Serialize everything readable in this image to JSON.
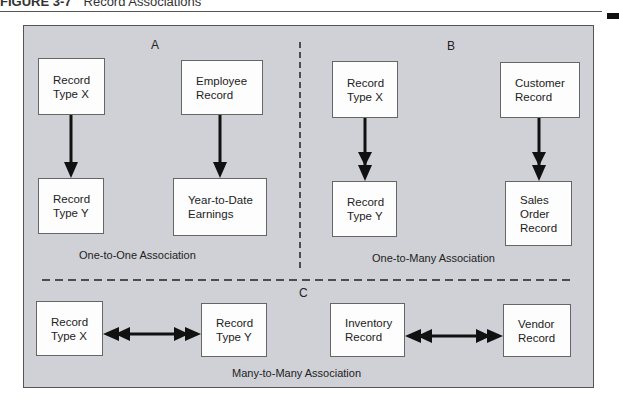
{
  "figure": {
    "number": "FIGURE 3-7",
    "title": "Record Associations"
  },
  "colors": {
    "panel_bg": "#cfd1d6",
    "box_bg": "#fdfdfd",
    "line": "#111111"
  },
  "sections": {
    "a": {
      "label": "A",
      "caption": "One-to-One Association",
      "relationships": [
        {
          "from": [
            "Record",
            "Type X"
          ],
          "to": [
            "Record",
            "Type Y"
          ],
          "arrow": "single"
        },
        {
          "from": [
            "Employee",
            "Record"
          ],
          "to": [
            "Year-to-Date",
            "Earnings"
          ],
          "arrow": "single"
        }
      ]
    },
    "b": {
      "label": "B",
      "caption": "One-to-Many Association",
      "relationships": [
        {
          "from": [
            "Record",
            "Type X"
          ],
          "to": [
            "Record",
            "Type Y"
          ],
          "arrow": "double"
        },
        {
          "from": [
            "Customer",
            "Record"
          ],
          "to": [
            "Sales",
            "Order",
            "Record"
          ],
          "arrow": "double"
        }
      ]
    },
    "c": {
      "label": "C",
      "caption": "Many-to-Many Association",
      "relationships": [
        {
          "from": [
            "Record",
            "Type X"
          ],
          "to": [
            "Record",
            "Type Y"
          ],
          "arrow": "double-both"
        },
        {
          "from": [
            "Inventory",
            "Record"
          ],
          "to": [
            "Vendor",
            "Record"
          ],
          "arrow": "double-both"
        }
      ]
    }
  }
}
